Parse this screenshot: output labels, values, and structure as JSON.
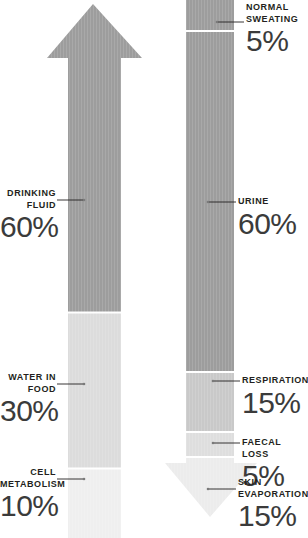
{
  "colors": {
    "dark_grey": "#9d9d9d",
    "mid_grey": "#c7c7c7",
    "light_grey": "#e8e8e8",
    "pale_grey": "#efefef",
    "text_dark": "#231f20",
    "number_grey": "#3b3b3b",
    "divider_white": "#ffffff",
    "background": "#ffffff"
  },
  "intake": {
    "arrow_name": "water-intake-arrow-up",
    "direction": "up",
    "segments": [
      {
        "id": "drinking-fluid",
        "label": "DRINKING\nFLUID",
        "value": "60%",
        "percent": 60,
        "color": "#9d9d9d"
      },
      {
        "id": "water-in-food",
        "label": "WATER IN\nFOOD",
        "value": "30%",
        "percent": 30,
        "color": "#dcdcdc"
      },
      {
        "id": "cell-metabolism",
        "label": "CELL\nMETABOLISM",
        "value": "10%",
        "percent": 10,
        "color": "#efefef"
      }
    ]
  },
  "output": {
    "arrow_name": "water-output-arrow-down",
    "direction": "down",
    "segments": [
      {
        "id": "normal-sweating",
        "label": "NORMAL\nSWEATING",
        "value": "5%",
        "percent": 5,
        "color": "#9d9d9d"
      },
      {
        "id": "urine",
        "label": "URINE",
        "value": "60%",
        "percent": 60,
        "color": "#9d9d9d"
      },
      {
        "id": "respiration",
        "label": "RESPIRATION",
        "value": "15%",
        "percent": 15,
        "color": "#c9c9c9"
      },
      {
        "id": "faecal-loss",
        "label": "FAECAL LOSS",
        "value": "5%",
        "percent": 5,
        "color": "#dedede"
      },
      {
        "id": "skin-evaporation",
        "label": "SKIN\nEVAPORATION",
        "value": "15%",
        "percent": 15,
        "color": "#ececec"
      }
    ]
  }
}
